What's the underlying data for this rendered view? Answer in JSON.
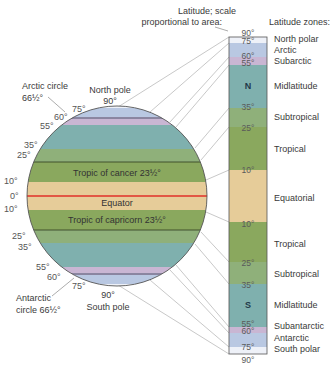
{
  "colors": {
    "polar": "#eef1f8",
    "arctic": "#b9c8e2",
    "subarctic": "#c9b6d3",
    "midlatitude": "#7fb0ae",
    "subtropical": "#8fb07a",
    "tropical": "#8aa85e",
    "equatorial": "#e6cc99",
    "equator_line": "#e0302a",
    "outline": "#555555",
    "leader": "#aaaaaa"
  },
  "headers": {
    "bar_title_line1": "Latitude; scale",
    "bar_title_line2": "proportional to area:",
    "zones_title": "Latitude zones:"
  },
  "globe": {
    "north_pole_line1": "North pole",
    "north_pole_line2": "90°",
    "south_pole_line1": "90°",
    "south_pole_line2": "South pole",
    "arctic_circle_line1": "Arctic circle",
    "arctic_circle_line2": "66½°",
    "antarctic_circle_line1": "Antarctic",
    "antarctic_circle_line2": "circle 66½°",
    "tropic_cancer": "Tropic of cancer 23½°",
    "tropic_capricorn": "Tropic of capricorn 23½°",
    "equator": "Equator",
    "degree_labels": {
      "n75": "75°",
      "n60": "60°",
      "n55": "55°",
      "n35": "35°",
      "n25": "25°",
      "n10": "10°",
      "eq": "0°",
      "s10": "10°",
      "s25": "25°",
      "s35": "35°",
      "s55": "55°",
      "s60": "60°",
      "s75": "75°"
    }
  },
  "bar": {
    "hemisphere_north": "N",
    "hemisphere_south": "S",
    "degree_labels": {
      "n90": "90°",
      "n75": "75°",
      "n60": "60°",
      "n55": "55°",
      "n35": "35°",
      "n25": "25°",
      "n10": "10°",
      "s10": "10°",
      "s25": "25°",
      "s35": "35°",
      "s55": "55°",
      "s60": "60°",
      "s75": "75°",
      "s90": "90°"
    }
  },
  "zones": [
    {
      "label": "North polar",
      "range": "90°–75°N"
    },
    {
      "label": "Arctic",
      "range": "75°–60°N"
    },
    {
      "label": "Subarctic",
      "range": "60°–55°N"
    },
    {
      "label": "Midlatitude",
      "range": "55°–35°N"
    },
    {
      "label": "Subtropical",
      "range": "35°–25°N"
    },
    {
      "label": "Tropical",
      "range": "25°–10°N"
    },
    {
      "label": "Equatorial",
      "range": "10°N–10°S"
    },
    {
      "label": "Tropical",
      "range": "10°–25°S"
    },
    {
      "label": "Subtropical",
      "range": "25°–35°S"
    },
    {
      "label": "Midlatitude",
      "range": "35°–55°S"
    },
    {
      "label": "Subantarctic",
      "range": "55°–60°S"
    },
    {
      "label": "Antarctic",
      "range": "60°–75°S"
    },
    {
      "label": "South polar",
      "range": "75°–90°S"
    }
  ]
}
